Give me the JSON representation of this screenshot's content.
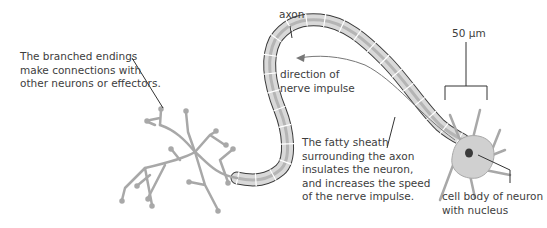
{
  "diagram": {
    "labels": {
      "branched_endings": [
        "The branched endings",
        "make connections with",
        "other neurons or effectors."
      ],
      "axon": "axon",
      "direction": [
        "direction of",
        "nerve impulse"
      ],
      "scale": "50 µm",
      "fatty_sheath": [
        "The fatty sheath",
        "surrounding the axon",
        "insulates the neuron,",
        "and increases the speed",
        "of the nerve impulse."
      ],
      "cell_body": [
        "cell body of neuron",
        "with nucleus"
      ]
    },
    "colors": {
      "outline": "#3a3a3a",
      "sheath_fill": "#d9d9d9",
      "dendrite": "#a8a8a8",
      "cell_body": "#d0d0d0",
      "nucleus": "#3a3a3a",
      "leader": "#333333"
    }
  }
}
